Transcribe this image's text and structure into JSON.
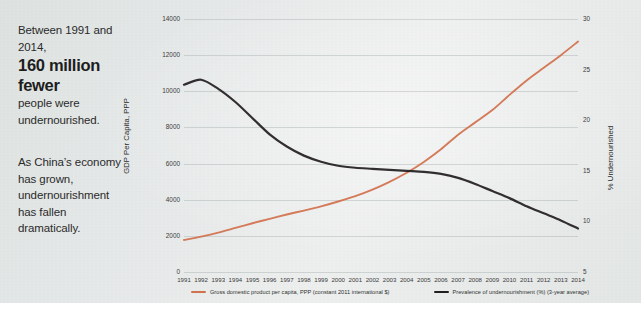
{
  "caption": {
    "para1_line1": "Between 1991 and",
    "para1_line2": "2014,",
    "para1_big1": "160 million",
    "para1_big2": "fewer",
    "para1_line3": "people were",
    "para1_line4": "undernourished.",
    "para2_line1": "As China’s economy",
    "para2_line2": "has grown,",
    "para2_line3": "undernourishment",
    "para2_line4": "has fallen",
    "para2_line5": "dramatically."
  },
  "chart_data": {
    "type": "line",
    "title": "",
    "xlabel": "",
    "ylabel": "GDP Per Capita, PPP",
    "ylabel_right": "% Undernourished",
    "grid": true,
    "legend_position": "bottom",
    "x": [
      1991,
      1992,
      1993,
      1994,
      1995,
      1996,
      1997,
      1998,
      1999,
      2000,
      2001,
      2002,
      2003,
      2004,
      2005,
      2006,
      2007,
      2008,
      2009,
      2010,
      2011,
      2012,
      2013,
      2014
    ],
    "xtick_labels": [
      "1991",
      "1992",
      "1993",
      "1994",
      "1995",
      "1996",
      "1997",
      "1998",
      "1999",
      "2000",
      "2001",
      "2002",
      "2003",
      "2004",
      "2005",
      "2006",
      "2007",
      "2008",
      "2009",
      "2010",
      "2011",
      "2012",
      "2013",
      "2014"
    ],
    "ylim": [
      0,
      14000
    ],
    "ytick_labels": [
      "0",
      "2000",
      "4000",
      "6000",
      "8000",
      "10000",
      "12000",
      "14000"
    ],
    "ytick_values": [
      0,
      2000,
      4000,
      6000,
      8000,
      10000,
      12000,
      14000
    ],
    "ylim_right": [
      5,
      30
    ],
    "ytick_labels_right": [
      "5",
      "10",
      "15",
      "20",
      "25",
      "30"
    ],
    "ytick_values_right": [
      5,
      10,
      15,
      20,
      25,
      30
    ],
    "series": [
      {
        "name": "Gross domestic product per capita, PPP (constant 2011 international $)",
        "axis": "left",
        "color": "#D2714E",
        "values": [
          1770,
          1960,
          2180,
          2440,
          2700,
          2940,
          3180,
          3400,
          3630,
          3900,
          4200,
          4560,
          4990,
          5490,
          6090,
          6790,
          7600,
          8280,
          8960,
          9800,
          10600,
          11300,
          12000,
          12750
        ]
      },
      {
        "name": "Prevalence of undernourishment (%) (3-year average)",
        "axis": "right",
        "color": "#231F20",
        "values": [
          23.5,
          24.0,
          23.1,
          21.8,
          20.2,
          18.6,
          17.4,
          16.5,
          15.9,
          15.5,
          15.3,
          15.2,
          15.1,
          15.0,
          14.9,
          14.7,
          14.3,
          13.7,
          13.0,
          12.3,
          11.5,
          10.8,
          10.1,
          9.3
        ]
      }
    ],
    "legend": [
      {
        "label": "Gross domestic product per capita, PPP (constant 2011 international $)",
        "color": "#D2714E"
      },
      {
        "label": "Prevalence of undernourishment (%) (3-year average)",
        "color": "#231F20"
      }
    ]
  }
}
